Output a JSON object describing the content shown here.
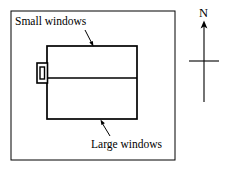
{
  "figure": {
    "type": "floor-plan-diagram",
    "background_color": "#ffffff",
    "line_color": "#000000",
    "outer_border": {
      "name": "plot-boundary",
      "x": 11,
      "y": 11,
      "width": 164,
      "height": 149,
      "stroke_width": 1
    },
    "building": {
      "name": "building-outline",
      "x": 47,
      "y": 46,
      "width": 90,
      "height": 73,
      "stroke_width": 1.6,
      "divider_y": 78
    },
    "small_window": {
      "name": "small-window-symbol",
      "x": 37,
      "y": 63,
      "width": 10,
      "height": 20,
      "inner_x": 40,
      "inner_y": 67,
      "inner_width": 4,
      "inner_height": 12
    }
  },
  "annotations": [
    {
      "id": "small-windows",
      "label": "Small windows",
      "leader": {
        "x1": 85,
        "y1": 30,
        "x2": 93,
        "y2": 45,
        "arrow_at": "end"
      }
    },
    {
      "id": "large-windows",
      "label": "Large windows",
      "leader": {
        "x1": 110,
        "y1": 136,
        "x2": 101,
        "y2": 121,
        "arrow_at": "end"
      }
    }
  ],
  "compass": {
    "name": "north-arrow",
    "label": "N",
    "shaft": {
      "x": 204,
      "y_top": 24,
      "y_bottom": 102
    },
    "crossbar": {
      "y": 61,
      "x1": 189,
      "x2": 219
    },
    "arrow_at": "top"
  }
}
